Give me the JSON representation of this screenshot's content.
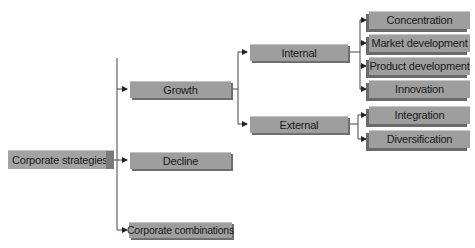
{
  "diagram": {
    "title": "Corporate strategies",
    "root": {
      "label": "Corporate strategies"
    },
    "level1": [
      {
        "label": "Growth"
      },
      {
        "label": "Decline"
      },
      {
        "label": "Corporate combinations"
      }
    ],
    "level2": [
      {
        "label": "Internal",
        "parent": "Growth"
      },
      {
        "label": "External",
        "parent": "Growth"
      }
    ],
    "level3": [
      {
        "label": "Concentration",
        "parent": "Internal"
      },
      {
        "label": "Market development",
        "parent": "Internal"
      },
      {
        "label": "Product development",
        "parent": "Internal"
      },
      {
        "label": "Innovation",
        "parent": "Internal"
      },
      {
        "label": "Integration",
        "parent": "External"
      },
      {
        "label": "Diversification",
        "parent": "External"
      }
    ],
    "colors": {
      "box": "#9e9e9e",
      "box_shadow": "#6e6e6e",
      "line": "#333333",
      "background": "#ffffff"
    }
  }
}
